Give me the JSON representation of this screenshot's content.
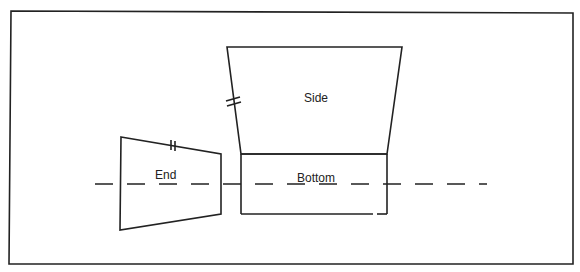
{
  "diagram": {
    "type": "box-net-layout",
    "labels": {
      "side": "Side",
      "bottom": "Bottom",
      "end": "End"
    },
    "colors": {
      "stroke": "#222222",
      "background": "#ffffff"
    },
    "annotations": {
      "tick_marks": "double tick marks indicate equal-length edges (End top edge and Side left edge)",
      "fold_line": "dashed line across End and Bottom"
    }
  }
}
